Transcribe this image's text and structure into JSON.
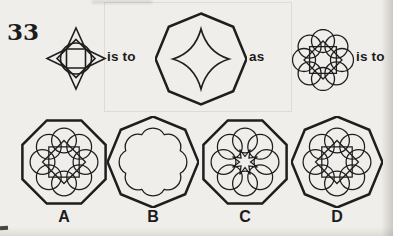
{
  "colors": {
    "paper": "#f0eeea",
    "ink": "#1c1c1c"
  },
  "question": {
    "number": "33"
  },
  "analogy": {
    "figure_a": "four-pointed-star-over-circle",
    "figure_b": "pointed-octagon-containing-concave-four-pointed-star",
    "figure_c": "rosette-of-eight-circles-with-two-overlapping-squares",
    "relations": [
      "is to",
      "as",
      "is to"
    ]
  },
  "options": [
    {
      "label": "A",
      "figure": "flat-top-octagon-with-circle-rosette-and-two-squares"
    },
    {
      "label": "B",
      "figure": "pointed-octagon-with-scalloped-flower-outline"
    },
    {
      "label": "C",
      "figure": "flat-top-octagon-with-eight-circles-and-central-eight-point-star"
    },
    {
      "label": "D",
      "figure": "pointed-octagon-with-circle-rosette-and-two-squares"
    }
  ]
}
